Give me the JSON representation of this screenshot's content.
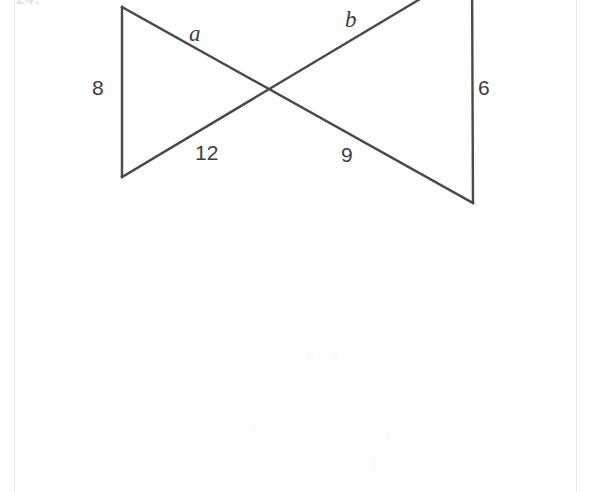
{
  "page": {
    "background_color": "#fefefe",
    "rule_color": "#e9eaec",
    "clipped_problem_number": "24."
  },
  "figure": {
    "name": "crossing-triangles-diagram",
    "stroke_color": "#4a4a4a",
    "stroke_width": 2.4,
    "vertices": {
      "left_top": [
        122,
        7
      ],
      "left_bottom": [
        122,
        177
      ],
      "right_top": [
        472,
        -32
      ],
      "right_bottom": [
        473,
        203
      ],
      "crossing": [
        272,
        92
      ]
    },
    "segments": [
      {
        "name": "left-vertical-side",
        "from": [
          122,
          7
        ],
        "to": [
          122,
          177
        ],
        "label": "8"
      },
      {
        "name": "right-vertical-side",
        "from": [
          472,
          -32
        ],
        "to": [
          473,
          203
        ],
        "label": "6"
      },
      {
        "name": "upper-left-to-lower-right-diagonal",
        "from": [
          122,
          7
        ],
        "to": [
          473,
          203
        ],
        "label_upper": "a",
        "label_lower": "9"
      },
      {
        "name": "lower-left-to-upper-right-diagonal",
        "from": [
          122,
          177
        ],
        "to": [
          472,
          -32
        ],
        "label_upper": "b",
        "label_lower": "12"
      }
    ],
    "labels": [
      {
        "id": "label-a",
        "text": "a",
        "style": "var",
        "x": 189,
        "y": 22
      },
      {
        "id": "label-b",
        "text": "b",
        "style": "var",
        "x": 345,
        "y": 8
      },
      {
        "id": "label-8",
        "text": "8",
        "style": "num",
        "x": 92,
        "y": 77
      },
      {
        "id": "label-6",
        "text": "6",
        "style": "num",
        "x": 478,
        "y": 77
      },
      {
        "id": "label-12",
        "text": "12",
        "style": "num",
        "x": 195,
        "y": 142
      },
      {
        "id": "label-9",
        "text": "9",
        "style": "num",
        "x": 341,
        "y": 144
      }
    ]
  }
}
